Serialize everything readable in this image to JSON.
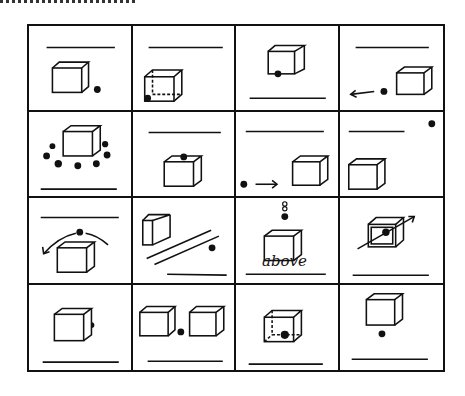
{
  "figure": {
    "rows": 4,
    "cols": 4,
    "ink_color": "#111111",
    "background": "#ffffff",
    "cells": [
      {
        "row": 1,
        "col": 1,
        "relation": "dot beside/next to cube (right, low)",
        "answer": ""
      },
      {
        "row": 1,
        "col": 2,
        "relation": "dot inside cube (transparent cube, bottom corner)",
        "answer": ""
      },
      {
        "row": 1,
        "col": 3,
        "relation": "dot under/below front edge of cube",
        "answer": ""
      },
      {
        "row": 1,
        "col": 4,
        "relation": "dot moving away from cube (arrow left)",
        "answer": ""
      },
      {
        "row": 2,
        "col": 1,
        "relation": "dots around cube",
        "answer": ""
      },
      {
        "row": 2,
        "col": 2,
        "relation": "dot on top of cube",
        "answer": ""
      },
      {
        "row": 2,
        "col": 3,
        "relation": "dot moving toward cube (arrow right)",
        "answer": ""
      },
      {
        "row": 2,
        "col": 4,
        "relation": "dot far from cube (corner)",
        "answer": ""
      },
      {
        "row": 3,
        "col": 1,
        "relation": "dot moving over cube (curved arrow)",
        "answer": ""
      },
      {
        "row": 3,
        "col": 2,
        "relation": "dot across (other side of) parallel lines from cube",
        "answer": ""
      },
      {
        "row": 3,
        "col": 3,
        "relation": "dot above cube",
        "answer": "above"
      },
      {
        "row": 3,
        "col": 4,
        "relation": "dot passing through cube (arrow)",
        "answer": ""
      },
      {
        "row": 4,
        "col": 1,
        "relation": "dot behind cube",
        "answer": ""
      },
      {
        "row": 4,
        "col": 2,
        "relation": "dot between two cubes",
        "answer": ""
      },
      {
        "row": 4,
        "col": 3,
        "relation": "dot inside cube (centre bottom)",
        "answer": ""
      },
      {
        "row": 4,
        "col": 4,
        "relation": "dot below cube",
        "answer": ""
      }
    ]
  },
  "labels": {
    "r3c3_answer": "above"
  }
}
